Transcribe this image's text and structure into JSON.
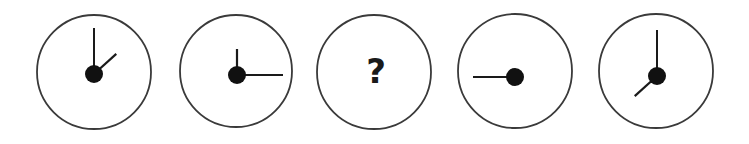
{
  "puzzle": {
    "title": "Clock sequence puzzle",
    "canvas": {
      "width": 749,
      "height": 144,
      "background": "#ffffff"
    },
    "style": {
      "dial_stroke": "#3a3a3a",
      "dial_fill": "#ffffff",
      "hand_color": "#1a1a1a",
      "hub_color": "#111111",
      "dial_stroke_width": 1.8,
      "hub_radius": 9
    },
    "missing_marker": "?",
    "clocks": [
      {
        "index": 1,
        "name": "clock-1",
        "center_x": 94,
        "center_y": 72,
        "radius": 57,
        "hub_x": 94,
        "hub_y": 74,
        "has_question_mark": false,
        "hands": [
          {
            "name": "minute-hand",
            "angle_deg": 0,
            "length": 46,
            "width": 2.0
          },
          {
            "name": "hour-hand",
            "angle_deg": 48,
            "length": 30,
            "width": 2.2
          }
        ]
      },
      {
        "index": 2,
        "name": "clock-2",
        "center_x": 236,
        "center_y": 71,
        "radius": 56,
        "hub_x": 237,
        "hub_y": 75,
        "has_question_mark": false,
        "hands": [
          {
            "name": "hour-hand",
            "angle_deg": 0,
            "length": 26,
            "width": 2.2
          },
          {
            "name": "minute-hand",
            "angle_deg": 90,
            "length": 46,
            "width": 2.0
          }
        ]
      },
      {
        "index": 3,
        "name": "clock-3",
        "center_x": 374,
        "center_y": 72,
        "radius": 57,
        "hub_x": 374,
        "hub_y": 72,
        "has_question_mark": true,
        "hands": []
      },
      {
        "index": 4,
        "name": "clock-4",
        "center_x": 515,
        "center_y": 71,
        "radius": 57,
        "hub_x": 515,
        "hub_y": 77,
        "has_question_mark": false,
        "hands": [
          {
            "name": "minute-hand",
            "angle_deg": 270,
            "length": 42,
            "width": 2.2
          }
        ]
      },
      {
        "index": 5,
        "name": "clock-5",
        "center_x": 656,
        "center_y": 71,
        "radius": 57,
        "hub_x": 657,
        "hub_y": 76,
        "has_question_mark": false,
        "hands": [
          {
            "name": "minute-hand",
            "angle_deg": 0,
            "length": 46,
            "width": 2.0
          },
          {
            "name": "hour-hand",
            "angle_deg": 228,
            "length": 30,
            "width": 2.2
          }
        ]
      }
    ]
  }
}
